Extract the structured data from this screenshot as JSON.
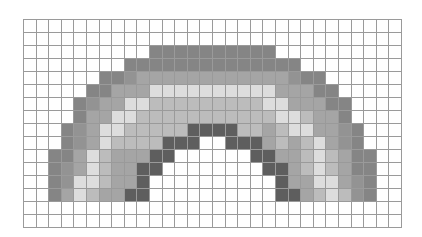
{
  "canvas": {
    "title": "",
    "columns": 30,
    "rows": 16,
    "palette": {
      "W": "#ffffff",
      "A": "#858585",
      "M": "#939393",
      "B": "#a5a5a5",
      "C": "#dddddd",
      "D": "#bcbcbc",
      "E": "#5e5e5e"
    },
    "palette_names": {
      "W": "empty",
      "A": "outer-band",
      "M": "outer-transition-band",
      "B": "second-band",
      "C": "light-band",
      "D": "fourth-band",
      "E": "inner-band"
    },
    "grid": [
      "WWWWWWWWWWWWWWWWWWWWWWWWWWWWWW",
      "WWWWWWWWWWWWWWWWWWWWWWWWWWWWWW",
      "WWWWWWWWWWAAAAAAAAAAWWWWWWWWWW",
      "WWWWWWWWAAAAAAAAAAAAAAWWWWWWWW",
      "WWWWWWAAMBBBBBBBBBBBBMAAWWWWWW",
      "WWWWWAABBBCCCCCCCCCCBBBAAWWWWW",
      "WWWWAMBBCCDDDDDDDDDCCBBBAAWWWW",
      "WWWWABBCCDDDDDDDDDDDCCDBBAWWWW",
      "WWWAMBCCDDDDDEEEEDDBDCCBBMAWWW",
      "WWWAMBCDDDDEEEWWEEEBDBDCBMAWWW",
      "WWAABCDBBBEEWWWWWWEEBBDCDBAAWW",
      "WWAMBCDBBEEWWWWWWWWEEBDCDBAAWW",
      "WWAMCCDBBEWWWWWWWWWWEBBCCBMAWW",
      "WWABCDBBEEWWWWWWWWWWEEBDCDMAWW",
      "WWWWWWWWWWWWWWWWWWWWWWWWWWWWWW",
      "WWWWWWWWWWWWWWWWWWWWWWWWWWWWWW"
    ]
  }
}
